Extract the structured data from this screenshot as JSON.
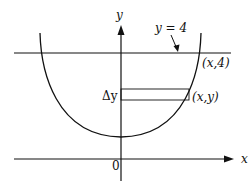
{
  "diagram": {
    "axes": {
      "x_label": "x",
      "y_label": "y",
      "origin_label": "0"
    },
    "line_label": "y = 4",
    "point_top_label": "(x,4)",
    "point_label": "(x,y)",
    "strip_label": "Δy"
  }
}
